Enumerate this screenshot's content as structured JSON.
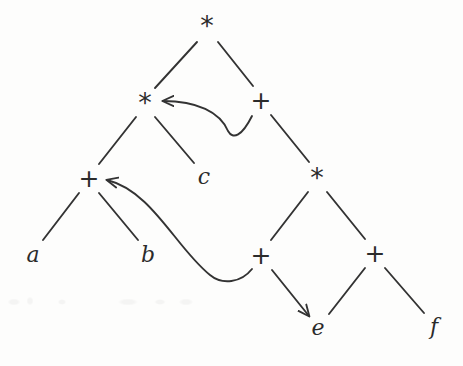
{
  "figure": {
    "kind": "expression-dag",
    "background_color": "#fdfdfc",
    "stroke_color": "#333333",
    "text_color": "#2b2b2b",
    "width": 463,
    "height": 366
  },
  "nodes": [
    {
      "id": "n-root-mul",
      "label": "*",
      "kind": "operator",
      "x": 207,
      "y": 25
    },
    {
      "id": "n-mul-left",
      "label": "*",
      "kind": "operator",
      "x": 145,
      "y": 102
    },
    {
      "id": "n-add-right",
      "label": "+",
      "kind": "operator",
      "x": 261,
      "y": 100
    },
    {
      "id": "n-add-ab",
      "label": "+",
      "kind": "operator",
      "x": 89,
      "y": 178
    },
    {
      "id": "n-mul-lower",
      "label": "*",
      "kind": "operator",
      "x": 317,
      "y": 177
    },
    {
      "id": "n-add-lower-left",
      "label": "+",
      "kind": "operator",
      "x": 261,
      "y": 255
    },
    {
      "id": "n-add-lower-right",
      "label": "+",
      "kind": "operator",
      "x": 375,
      "y": 253
    },
    {
      "id": "n-leaf-a",
      "label": "a",
      "kind": "leaf",
      "x": 33,
      "y": 255
    },
    {
      "id": "n-leaf-b",
      "label": "b",
      "kind": "leaf",
      "x": 148,
      "y": 255
    },
    {
      "id": "n-leaf-c",
      "label": "c",
      "kind": "leaf",
      "x": 204,
      "y": 177
    },
    {
      "id": "n-leaf-e",
      "label": "e",
      "kind": "leaf",
      "x": 318,
      "y": 328
    },
    {
      "id": "n-leaf-f",
      "label": "f",
      "kind": "leaf",
      "x": 434,
      "y": 327
    }
  ],
  "edges": [
    {
      "id": "e-root-to-mulleft",
      "from": "n-root-mul",
      "to": "n-mul-left",
      "type": "line",
      "d": "M 197 42 L 155 88"
    },
    {
      "id": "e-root-to-addright",
      "from": "n-root-mul",
      "to": "n-add-right",
      "type": "line",
      "d": "M 218 42 L 253 86"
    },
    {
      "id": "e-mulleft-to-addab",
      "from": "n-mul-left",
      "to": "n-add-ab",
      "type": "line",
      "d": "M 136 117 L 99 164"
    },
    {
      "id": "e-mulleft-to-c",
      "from": "n-mul-left",
      "to": "n-leaf-c",
      "type": "line",
      "d": "M 155 117 L 194 163"
    },
    {
      "id": "e-addright-to-mullow",
      "from": "n-add-right",
      "to": "n-mul-lower",
      "type": "line",
      "d": "M 271 115 L 309 162"
    },
    {
      "id": "e-addab-to-a",
      "from": "n-add-ab",
      "to": "n-leaf-a",
      "type": "line",
      "d": "M 79 193 L 43 240"
    },
    {
      "id": "e-addab-to-b",
      "from": "n-add-ab",
      "to": "n-leaf-b",
      "type": "line",
      "d": "M 99 193 L 138 240"
    },
    {
      "id": "e-mullow-to-addll",
      "from": "n-mul-lower",
      "to": "n-add-lower-left",
      "type": "line",
      "d": "M 308 192 L 271 240"
    },
    {
      "id": "e-mullow-to-addlr",
      "from": "n-mul-lower",
      "to": "n-add-lower-right",
      "type": "line",
      "d": "M 327 192 L 365 239"
    },
    {
      "id": "e-addlr-to-e",
      "from": "n-add-lower-right",
      "to": "n-leaf-e",
      "type": "line",
      "d": "M 365 268 L 329 314"
    },
    {
      "id": "e-addlr-to-f",
      "from": "n-add-lower-right",
      "to": "n-leaf-f",
      "type": "line",
      "d": "M 385 268 L 424 313"
    },
    {
      "id": "e-addll-to-e",
      "from": "n-add-lower-left",
      "to": "n-leaf-e",
      "type": "arrow",
      "d": "M 272 270 L 309 316"
    },
    {
      "id": "e-addright-to-mulleft",
      "from": "n-add-right",
      "to": "n-mul-left",
      "type": "curved-arrow",
      "d": "M 252 116 C 242 136 233 140 228 131 C 220 112 197 101 163 101"
    },
    {
      "id": "e-addll-to-addab",
      "from": "n-add-lower-left",
      "to": "n-add-ab",
      "type": "curved-arrow",
      "d": "M 252 269 C 241 283 222 285 210 275 C 176 248 152 191 107 180"
    }
  ],
  "markers": {
    "arrowhead_id": "arrow-head",
    "arrowhead_color": "#333333"
  }
}
